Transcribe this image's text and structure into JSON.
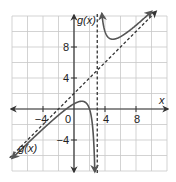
{
  "chart_data": {
    "type": "line",
    "title": "",
    "xlabel": "x",
    "ylabel": "g(x)",
    "xlim": [
      -8,
      12
    ],
    "ylim": [
      -8,
      12
    ],
    "grid": true,
    "grid_step": 2,
    "x_ticks": [
      {
        "value": -4,
        "label": "−4"
      },
      {
        "value": 0,
        "label": "0"
      },
      {
        "value": 4,
        "label": "4"
      },
      {
        "value": 8,
        "label": "8"
      }
    ],
    "y_ticks": [
      {
        "value": 8,
        "label": "8"
      },
      {
        "value": 4,
        "label": "4"
      },
      {
        "value": -4,
        "label": "−4"
      }
    ],
    "function": {
      "name": "g(x)",
      "expression": "x + 2 + 4/(x - 3)",
      "branches": [
        {
          "x_from": -8,
          "x_to": 2.85,
          "direction": "both-ends-arrow"
        },
        {
          "x_from": 3.35,
          "x_to": 10.3,
          "direction": "both-ends-arrow"
        }
      ],
      "curve_labels": [
        {
          "text": "g(x)",
          "near": "lower-left branch"
        }
      ],
      "key_points": [
        {
          "x": -1,
          "y": 0
        },
        {
          "x": 1,
          "y": 1
        },
        {
          "x": 2,
          "y": 0
        },
        {
          "x": 5,
          "y": 9
        }
      ]
    },
    "asymptotes": [
      {
        "type": "vertical",
        "equation": "x = 3",
        "style": "dashed"
      },
      {
        "type": "oblique",
        "equation": "y = x + 2",
        "style": "dashed"
      }
    ],
    "axis_labels": {
      "x": "x",
      "y": "g(x)"
    }
  }
}
